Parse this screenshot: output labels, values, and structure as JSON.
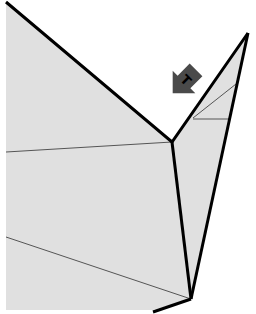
{
  "diagram": {
    "background": "#ffffff",
    "face_fill": "#e0e0e0",
    "edge_color": "#000000",
    "crease_color": "#555555",
    "marker": {
      "label": "T",
      "fill": "#4a4a4a",
      "label_color": "#000000",
      "direction": "down-right"
    }
  }
}
